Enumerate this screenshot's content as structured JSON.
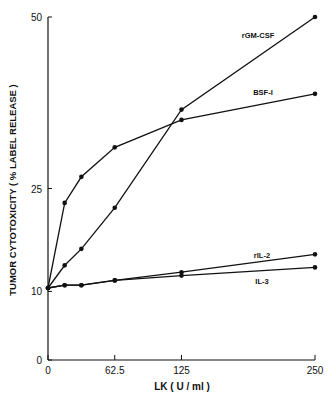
{
  "chart_data": {
    "type": "line",
    "title": "",
    "xlabel": "LK  ( U / ml )",
    "ylabel": "TUMOR  CYTOTOXICITY  ( %  LABEL  RELEASE )",
    "x_ticks": [
      "0",
      "62.5",
      "125",
      "250"
    ],
    "y_ticks": [
      "0",
      "10",
      "25",
      "50"
    ],
    "xlim": [
      0,
      250
    ],
    "ylim": [
      0,
      50
    ],
    "grid": false,
    "legend_position": "inline labels near line ends",
    "x": [
      0,
      15.6,
      31.25,
      62.5,
      125,
      250
    ],
    "series": [
      {
        "name": "rGM-CSF",
        "values": [
          10.5,
          13.8,
          16.2,
          22.2,
          36.5,
          50.0
        ]
      },
      {
        "name": "BSF-I",
        "values": [
          10.5,
          22.9,
          26.7,
          31.0,
          35.0,
          38.8
        ]
      },
      {
        "name": "rIL-2",
        "values": [
          10.5,
          10.9,
          10.9,
          11.6,
          12.8,
          15.4
        ]
      },
      {
        "name": "IL-3",
        "values": [
          10.5,
          10.9,
          10.9,
          11.6,
          12.3,
          13.5
        ]
      }
    ]
  },
  "labels": {
    "series_labels": [
      "rGM-CSF",
      "BSF-I",
      "rIL-2",
      "IL-3"
    ]
  }
}
